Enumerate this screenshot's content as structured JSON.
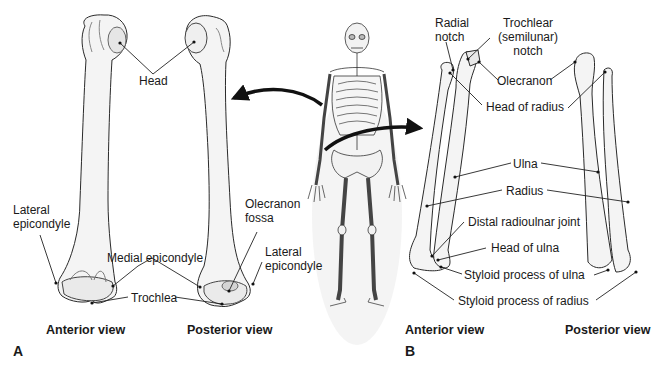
{
  "figure": {
    "panels": [
      {
        "letter": "A",
        "subject": "Humerus",
        "views": [
          "Anterior view",
          "Posterior view"
        ],
        "labels": {
          "head": "Head",
          "lateral_epicondyle_left": "Lateral epicondyle",
          "medial_epicondyle": "Medial epicondyle",
          "trochlea": "Trochlea",
          "olecranon_fossa": "Olecranon fossa",
          "lateral_epicondyle_right": "Lateral epicondyle"
        }
      },
      {
        "letter": "B",
        "subject": "Radius and ulna",
        "views": [
          "Anterior view",
          "Posterior view"
        ],
        "labels": {
          "radial_notch": "Radial notch",
          "trochlear_notch": "Trochlear (semilunar) notch",
          "olecranon": "Olecranon",
          "head_of_radius": "Head of radius",
          "ulna": "Ulna",
          "radius": "Radius",
          "distal_radioulnar_joint": "Distal radioulnar joint",
          "head_of_ulna": "Head of ulna",
          "styloid_process_of_ulna": "Styloid process of ulna",
          "styloid_process_of_radius": "Styloid process of radius"
        }
      }
    ],
    "center_illustration": "full-skeleton-anterior",
    "colors": {
      "bone_fill": "#f4f4f4",
      "bone_shade": "#dcdcdc",
      "outline": "#2a2a2a",
      "arrow": "#111111",
      "text": "#1a1a1a"
    }
  }
}
